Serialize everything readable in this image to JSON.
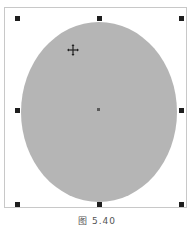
{
  "canvas": {
    "shape": "ellipse",
    "fill_color": "#b5b5b5",
    "handle_color": "#1e1e1e",
    "frame_color": "#c8c8c8"
  },
  "handles": [
    {
      "name": "top-left",
      "x": 15,
      "y": 16
    },
    {
      "name": "top-center",
      "x": 97,
      "y": 16
    },
    {
      "name": "top-right",
      "x": 179,
      "y": 16
    },
    {
      "name": "middle-left",
      "x": 15,
      "y": 108
    },
    {
      "name": "middle-right",
      "x": 179,
      "y": 108
    },
    {
      "name": "bottom-left",
      "x": 15,
      "y": 202
    },
    {
      "name": "bottom-center",
      "x": 97,
      "y": 202
    },
    {
      "name": "bottom-right",
      "x": 179,
      "y": 202
    }
  ],
  "cursor": {
    "icon": "move-cursor-icon"
  },
  "caption": "图 5.40"
}
